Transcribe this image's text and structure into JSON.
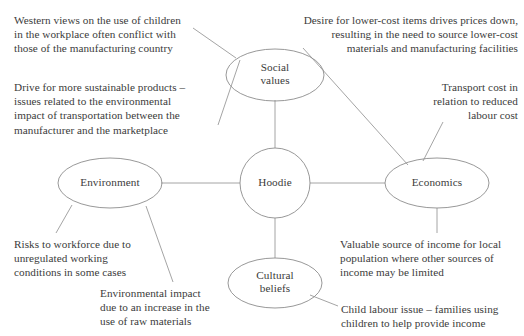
{
  "diagram": {
    "center_node": {
      "label": "Hoodie"
    },
    "nodes": [
      {
        "id": "social-values",
        "label": "Social\nvalues"
      },
      {
        "id": "environment",
        "label": "Environment"
      },
      {
        "id": "economics",
        "label": "Economics"
      },
      {
        "id": "cultural-beliefs",
        "label": "Cultural\nbeliefs"
      }
    ],
    "notes": [
      {
        "id": "note-western-views",
        "text": "Western views on the use of children\nin the workplace often conflict with\nthose of the manufacturing country"
      },
      {
        "id": "note-sustainable-products",
        "text": "Drive for more sustainable products –\nissues related to the environmental\nimpact of transportation between the\nmanufacturer and the marketplace"
      },
      {
        "id": "note-lower-cost-items",
        "text": "Desire for lower-cost items drives prices down,\nresulting in the need to source lower-cost\nmaterials and manufacturing facilities"
      },
      {
        "id": "note-transport-cost",
        "text": "Transport cost in\nrelation to reduced\nlabour cost"
      },
      {
        "id": "note-risks-workforce",
        "text": "Risks to workforce due to\nunregulated working\nconditions in some cases"
      },
      {
        "id": "note-environmental-impact",
        "text": "Environmental impact\ndue to an increase in the\nuse of raw materials"
      },
      {
        "id": "note-valuable-income",
        "text": "Valuable source of income for local\npopulation where other sources of\nincome may be limited"
      },
      {
        "id": "note-child-labour",
        "text": "Child labour issue – families using\nchildren to help provide income"
      }
    ],
    "colors": {
      "stroke": "#8c8c8c",
      "text": "#3b3b3b",
      "background": "#ffffff"
    }
  }
}
